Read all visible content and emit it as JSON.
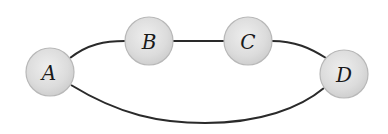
{
  "diagram": {
    "type": "graph",
    "nodes": [
      {
        "id": "A",
        "label": "A",
        "cx": 50,
        "cy": 72,
        "r": 24
      },
      {
        "id": "B",
        "label": "B",
        "cx": 149,
        "cy": 41,
        "r": 24
      },
      {
        "id": "C",
        "label": "C",
        "cx": 248,
        "cy": 41,
        "r": 24
      },
      {
        "id": "D",
        "label": "D",
        "cx": 344,
        "cy": 74,
        "r": 24
      }
    ],
    "edges": [
      {
        "from": "A",
        "to": "B"
      },
      {
        "from": "B",
        "to": "C"
      },
      {
        "from": "C",
        "to": "D"
      },
      {
        "from": "A",
        "to": "D"
      }
    ],
    "colors": {
      "node_fill": "#dcdcdc",
      "node_stroke": "#b8b8b8",
      "edge": "#2a2a2a",
      "label": "#1a1a1a"
    }
  }
}
